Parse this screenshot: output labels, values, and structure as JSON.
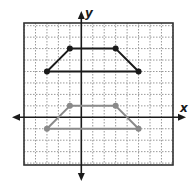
{
  "chart_data": {
    "type": "scatter",
    "title": "",
    "xlabel": "x",
    "ylabel": "y",
    "xlim": [
      -5,
      8
    ],
    "ylim": [
      -4,
      8
    ],
    "grid": true,
    "grid_style": "dotted",
    "unit_px": 11.45,
    "origin_px": [
      81.3,
      117.3
    ],
    "frame_px": {
      "left": 24,
      "top": 23,
      "right": 173,
      "bottom": 165
    },
    "series": [
      {
        "name": "original-trapezoid",
        "color": "#1a1a1a",
        "closed": true,
        "points": [
          [
            -1,
            6
          ],
          [
            3,
            6
          ],
          [
            5,
            4
          ],
          [
            -3,
            4
          ]
        ]
      },
      {
        "name": "translated-trapezoid",
        "color": "#8a8a8a",
        "closed": true,
        "points": [
          [
            -1,
            1
          ],
          [
            3,
            1
          ],
          [
            5,
            -1
          ],
          [
            -3,
            -1
          ]
        ]
      }
    ]
  },
  "labels": {
    "x_axis": "x",
    "y_axis": "y"
  },
  "colors": {
    "frame": "#333333",
    "grid": "#9a9a9a",
    "axis": "#1a1a1a"
  }
}
